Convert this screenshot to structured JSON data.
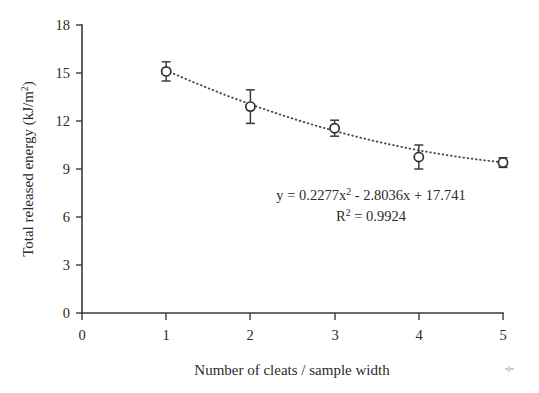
{
  "chart_data": {
    "type": "scatter",
    "title": "",
    "xlabel": "Number of cleats / sample width",
    "ylabel": "Total released energy (kJ/m²)",
    "ylabel_main": "Total released energy (kJ/m",
    "ylabel_sup": "2",
    "ylabel_tail": ")",
    "xlim": [
      0,
      5
    ],
    "ylim": [
      0,
      18
    ],
    "grid": false,
    "legend": false,
    "x": [
      1,
      2,
      3,
      4,
      5
    ],
    "values": [
      15.1,
      12.9,
      11.55,
      9.75,
      9.4
    ],
    "error_bars": [
      0.6,
      1.05,
      0.5,
      0.75,
      0.3
    ],
    "xticks": [
      "0",
      "1",
      "2",
      "3",
      "4",
      "5"
    ],
    "yticks": [
      "0",
      "3",
      "6",
      "9",
      "12",
      "15",
      "18"
    ],
    "xtick_values": [
      0,
      1,
      2,
      3,
      4,
      5
    ],
    "ytick_values": [
      0,
      3,
      6,
      9,
      12,
      15,
      18
    ],
    "marker": "open-circle",
    "trendline": {
      "style": "dotted",
      "type": "polynomial-order-2",
      "coefficients": [
        0.2277,
        -2.8036,
        17.741
      ]
    },
    "annotations": {
      "equation": "y = 0.2277x² - 2.8036x + 17.741",
      "equation_prefix": "y = 0.2277x",
      "equation_sup": "2",
      "equation_rest": " - 2.8036x + 17.741",
      "r_squared": "R² = 0.9924",
      "r_squared_prefix": "R",
      "r_squared_sup": "2",
      "r_squared_rest": " = 0.9924"
    },
    "colors": {
      "axis": "#3a3a3a",
      "marker_stroke": "#303030",
      "marker_fill": "#ffffff",
      "trendline": "#4a4a4a",
      "text": "#2b2b2b",
      "background": "#ffffff"
    }
  }
}
